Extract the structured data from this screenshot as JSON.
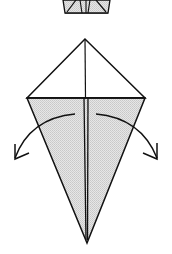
{
  "diagram": {
    "type": "origami-step",
    "colors": {
      "paper_front": "#ffffff",
      "paper_back": "#dcdcdc",
      "stroke": "#111111",
      "background": "#ffffff"
    },
    "previous_step_fragment": {
      "description": "bottom of previous step figure (trapezoid with fold flaps)"
    },
    "main_figure": {
      "shape": "kite",
      "apex": [
        85,
        39
      ],
      "left_corner": [
        27,
        98
      ],
      "right_corner": [
        145,
        98
      ],
      "bottom_point": [
        87,
        243
      ]
    },
    "arrows": [
      {
        "name": "fold-left-arrow",
        "direction": "left",
        "meaning": "unfold flap outward"
      },
      {
        "name": "fold-right-arrow",
        "direction": "right",
        "meaning": "unfold flap outward"
      }
    ]
  }
}
